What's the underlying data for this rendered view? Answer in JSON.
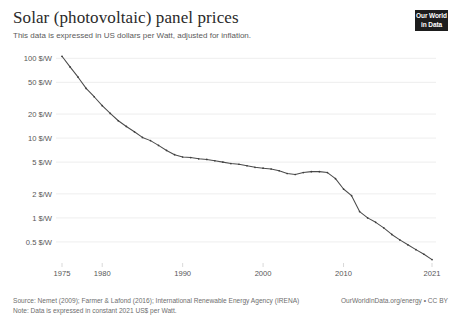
{
  "header": {
    "title": "Solar (photovoltaic) panel prices",
    "subtitle": "This data is expressed in US dollars per Watt, adjusted for inflation."
  },
  "logo": {
    "line1": "Our World",
    "line2": "in Data"
  },
  "footer": {
    "source": "Source: Nemet (2009); Farmer & Lafond (2016); International Renewable Energy Agency (IRENA)",
    "note": "Note: Data is expressed in constant 2021 US$ per Watt.",
    "attribution": "OurWorldInData.org/energy",
    "separator": "•",
    "license": "CC BY"
  },
  "chart_data": {
    "type": "line",
    "title": "Solar (photovoltaic) panel prices",
    "subtitle": "This data is expressed in US dollars per Watt, adjusted for inflation.",
    "xlabel": "",
    "ylabel": "",
    "yscale": "log",
    "ylim": [
      0.28,
      120
    ],
    "xlim": [
      1975,
      2021
    ],
    "grid": true,
    "legend": false,
    "y_unit": "$/W",
    "ytick_values": [
      0.5,
      1,
      2,
      5,
      10,
      20,
      50,
      100
    ],
    "ytick_labels": [
      "0.5 $/W",
      "1 $/W",
      "2 $/W",
      "5 $/W",
      "10 $/W",
      "20 $/W",
      "50 $/W",
      "100 $/W"
    ],
    "xtick_values": [
      1975,
      1980,
      1990,
      2000,
      2010,
      2021
    ],
    "xtick_labels": [
      "1975",
      "1980",
      "1990",
      "2000",
      "2010",
      "2021"
    ],
    "line_color": "#4c4c4c",
    "series": [
      {
        "name": "Solar PV module price",
        "x": [
          1975,
          1976,
          1977,
          1978,
          1979,
          1980,
          1981,
          1982,
          1983,
          1984,
          1985,
          1986,
          1987,
          1988,
          1989,
          1990,
          1991,
          1992,
          1993,
          1994,
          1995,
          1996,
          1997,
          1998,
          1999,
          2000,
          2001,
          2002,
          2003,
          2004,
          2005,
          2006,
          2007,
          2008,
          2009,
          2010,
          2011,
          2012,
          2013,
          2014,
          2015,
          2016,
          2017,
          2018,
          2019,
          2020,
          2021
        ],
        "values": [
          106,
          78,
          58,
          42,
          33,
          25.5,
          20.4,
          16.5,
          14.0,
          12.0,
          10.2,
          9.3,
          8.1,
          7.0,
          6.2,
          5.8,
          5.7,
          5.5,
          5.4,
          5.2,
          5.0,
          4.8,
          4.7,
          4.5,
          4.3,
          4.2,
          4.1,
          3.9,
          3.6,
          3.5,
          3.7,
          3.8,
          3.8,
          3.7,
          3.1,
          2.3,
          1.9,
          1.2,
          1.0,
          0.88,
          0.75,
          0.62,
          0.53,
          0.46,
          0.4,
          0.35,
          0.3
        ]
      }
    ]
  }
}
